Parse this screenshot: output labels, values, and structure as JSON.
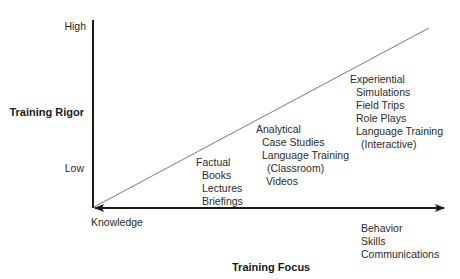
{
  "diagram": {
    "y_axis": {
      "title": "Training Rigor",
      "high_label": "High",
      "low_label": "Low"
    },
    "x_axis": {
      "title": "Training Focus",
      "left_label": "Knowledge",
      "right_label": {
        "heading": "Behavior",
        "items": [
          "Skills",
          "Communications"
        ]
      }
    },
    "groups": [
      {
        "heading": "Factual",
        "items": [
          "Books",
          "Lectures",
          "Briefings"
        ]
      },
      {
        "heading": "Analytical",
        "items": [
          "Case Studies",
          "Language Training",
          "(Classroom)",
          "Videos"
        ]
      },
      {
        "heading": "Experiential",
        "items": [
          "Simulations",
          "Field Trips",
          "Role Plays",
          "Language Training",
          "(Interactive)"
        ]
      }
    ],
    "colors": {
      "axis": "#1a1a1a",
      "diagonal": "#555555",
      "text": "#2a2a2a"
    }
  }
}
